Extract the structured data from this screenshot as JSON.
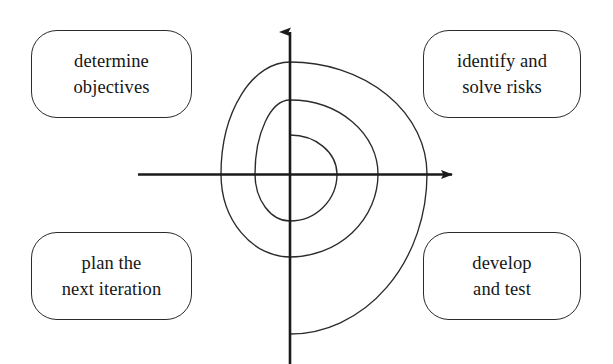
{
  "diagram": {
    "type": "spiral-quadrant-diagram",
    "stroke_color": "#2b2b2b",
    "axis_color": "#1a1a1a",
    "background_color": "#ffffff",
    "center": {
      "x": 290,
      "y": 174
    },
    "axes": {
      "vertical": {
        "x": 290,
        "top_y": 25,
        "bottom_y": 364,
        "arrow": "up"
      },
      "horizontal": {
        "y": 174,
        "left_x": 138,
        "right_x": 462,
        "arrow": "right"
      }
    },
    "spiral": {
      "turns": 3,
      "direction": "clockwise-outward",
      "axis_crossings": {
        "left_x": [
          255,
          221,
          174
        ],
        "right_x": [
          337,
          378,
          427
        ],
        "up_y": [
          135,
          100,
          62
        ],
        "down_y": [
          221,
          257,
          334
        ]
      }
    },
    "quadrant_labels": [
      {
        "id": "determine-objectives",
        "quadrant": "top-left",
        "lines": [
          "determine",
          "objectives"
        ]
      },
      {
        "id": "identify-risks",
        "quadrant": "top-right",
        "lines": [
          "identify and",
          "solve risks"
        ]
      },
      {
        "id": "plan-next-iteration",
        "quadrant": "bottom-left",
        "lines": [
          "plan the",
          "next iteration"
        ]
      },
      {
        "id": "develop-and-test",
        "quadrant": "bottom-right",
        "lines": [
          "develop",
          "and test"
        ]
      }
    ]
  }
}
